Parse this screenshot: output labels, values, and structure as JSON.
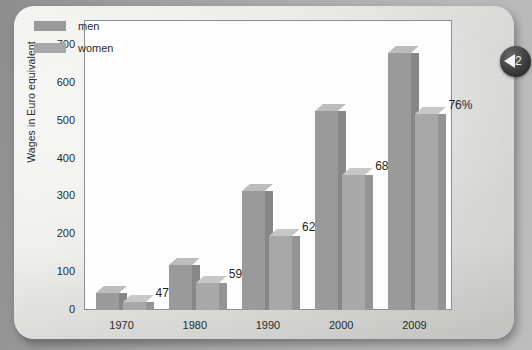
{
  "page": {
    "badge_number": "2",
    "badge_arrow_icon": "triangle-left-icon"
  },
  "legend": {
    "items": [
      {
        "label": "men",
        "color": "#9a9a9a",
        "key": "men"
      },
      {
        "label": "women",
        "color": "#a8a8a8",
        "key": "women"
      }
    ]
  },
  "chart_data": {
    "type": "bar",
    "title": "",
    "xlabel": "",
    "ylabel": "Wages in Euro equivalent",
    "ylim": [
      0,
      700
    ],
    "yticks": [
      0,
      100,
      200,
      300,
      400,
      500,
      600,
      700
    ],
    "ytick_labels": [
      "0",
      "100",
      "200",
      "300",
      "400",
      "500",
      "600",
      "700"
    ],
    "grid": false,
    "legend_position": "top-left",
    "style": "3d-grouped-bar",
    "categories": [
      "1970",
      "1980",
      "1990",
      "2000",
      "2009"
    ],
    "series": [
      {
        "name": "men",
        "color": "#9a9a9a",
        "values": [
          45,
          120,
          315,
          525,
          680
        ]
      },
      {
        "name": "women",
        "color": "#a8a8a8",
        "values": [
          21,
          71,
          195,
          357,
          517
        ]
      }
    ],
    "annotations": [
      {
        "category": "1970",
        "text": "47%"
      },
      {
        "category": "1980",
        "text": "59%"
      },
      {
        "category": "1990",
        "text": "62%"
      },
      {
        "category": "2000",
        "text": "68%"
      },
      {
        "category": "2009",
        "text": "76%"
      }
    ]
  }
}
